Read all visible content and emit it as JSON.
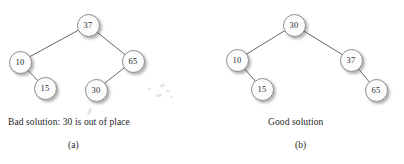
{
  "figure": {
    "background_color": "#ffffff",
    "node_fill_color": "#fcfcfc",
    "node_stroke_color": "#8d8d8d",
    "edge_color": "#555555",
    "text_color": "#262626"
  },
  "panels": [
    {
      "id": "a",
      "caption": "Bad solution: 30 is out of place",
      "sublabel": "(a)",
      "tree": {
        "nodes": [
          {
            "key": "a-root",
            "label": "37",
            "cx": 88,
            "cy": 25
          },
          {
            "key": "a-left",
            "label": "10",
            "cx": 20,
            "cy": 62
          },
          {
            "key": "a-right",
            "label": "65",
            "cx": 133,
            "cy": 61
          },
          {
            "key": "a-ll",
            "label": "15",
            "cx": 45,
            "cy": 88
          },
          {
            "key": "a-rl",
            "label": "30",
            "cx": 96,
            "cy": 90
          }
        ],
        "edges": [
          {
            "from": "a-root",
            "to": "a-left"
          },
          {
            "from": "a-root",
            "to": "a-right"
          },
          {
            "from": "a-left",
            "to": "a-ll"
          },
          {
            "from": "a-right",
            "to": "a-rl"
          }
        ]
      }
    },
    {
      "id": "b",
      "caption": "Good solution",
      "sublabel": "(b)",
      "tree": {
        "nodes": [
          {
            "key": "b-root",
            "label": "30",
            "cx": 92,
            "cy": 25
          },
          {
            "key": "b-left",
            "label": "10",
            "cx": 35,
            "cy": 60
          },
          {
            "key": "b-right",
            "label": "37",
            "cx": 149,
            "cy": 60
          },
          {
            "key": "b-ll",
            "label": "15",
            "cx": 60,
            "cy": 89
          },
          {
            "key": "b-rr",
            "label": "65",
            "cx": 174,
            "cy": 90
          }
        ],
        "edges": [
          {
            "from": "b-root",
            "to": "b-left"
          },
          {
            "from": "b-root",
            "to": "b-right"
          },
          {
            "from": "b-left",
            "to": "b-ll"
          },
          {
            "from": "b-right",
            "to": "b-rr"
          }
        ]
      }
    }
  ],
  "artifacts": [
    {
      "x": 160,
      "y": 84,
      "w": 5,
      "h": 3,
      "rot": -25
    },
    {
      "x": 166,
      "y": 90,
      "w": 4,
      "h": 2,
      "rot": 15
    },
    {
      "x": 156,
      "y": 94,
      "w": 6,
      "h": 3,
      "rot": -10
    },
    {
      "x": 170,
      "y": 96,
      "w": 3,
      "h": 2,
      "rot": 40
    },
    {
      "x": 148,
      "y": 88,
      "w": 3,
      "h": 2,
      "rot": 5
    },
    {
      "x": 88,
      "y": 108,
      "w": 3,
      "h": 7,
      "rot": 22
    }
  ]
}
